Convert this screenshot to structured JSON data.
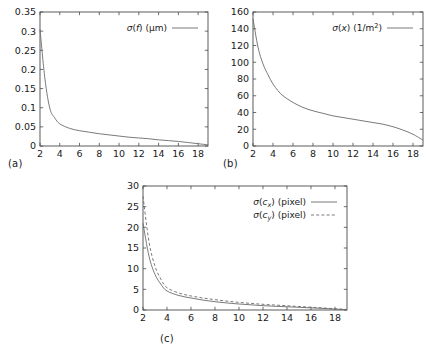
{
  "figure": {
    "panel_labels": {
      "a": "(a)",
      "b": "(b)",
      "c": "(c)"
    }
  },
  "chart_data": [
    {
      "id": "panel-a",
      "type": "line",
      "title": "",
      "panel_label": "(a)",
      "xlabel": "",
      "ylabel": "",
      "xlim": [
        2,
        19
      ],
      "ylim": [
        0,
        0.35
      ],
      "xticks": [
        2,
        4,
        6,
        8,
        10,
        12,
        14,
        16,
        18
      ],
      "xtick_labels": [
        "2",
        "4",
        "6",
        "8",
        "10",
        "12",
        "14",
        "16",
        "18"
      ],
      "yticks": [
        0,
        0.05,
        0.1,
        0.15,
        0.2,
        0.25,
        0.3,
        0.35
      ],
      "ytick_labels": [
        "0",
        "0.05",
        "0.1",
        "0.15",
        "0.2",
        "0.25",
        "0.3",
        "0.35"
      ],
      "grid": false,
      "legend_position": "upper-right",
      "series": [
        {
          "name": "σ(f) (μm)",
          "style": "solid",
          "color": "#6b6b6b",
          "x": [
            2,
            2.5,
            3,
            3.5,
            4,
            5,
            6,
            7,
            8,
            9,
            10,
            11,
            12,
            13,
            14,
            15,
            16,
            17,
            18,
            19
          ],
          "values": [
            0.305,
            0.175,
            0.098,
            0.073,
            0.058,
            0.046,
            0.04,
            0.036,
            0.032,
            0.029,
            0.026,
            0.023,
            0.021,
            0.019,
            0.016,
            0.014,
            0.012,
            0.009,
            0.006,
            0.003
          ]
        }
      ]
    },
    {
      "id": "panel-b",
      "type": "line",
      "title": "",
      "panel_label": "(b)",
      "xlabel": "",
      "ylabel": "",
      "xlim": [
        2,
        19
      ],
      "ylim": [
        0,
        160
      ],
      "xticks": [
        2,
        4,
        6,
        8,
        10,
        12,
        14,
        16,
        18
      ],
      "xtick_labels": [
        "2",
        "4",
        "6",
        "8",
        "10",
        "12",
        "14",
        "16",
        "18"
      ],
      "yticks": [
        0,
        20,
        40,
        60,
        80,
        100,
        120,
        140,
        160
      ],
      "ytick_labels": [
        "0",
        "20",
        "40",
        "60",
        "80",
        "100",
        "120",
        "140",
        "160"
      ],
      "grid": false,
      "legend_position": "upper-right",
      "series": [
        {
          "name": "σ(x) (1/m²)",
          "style": "solid",
          "color": "#6b6b6b",
          "x": [
            2,
            2.5,
            3,
            3.5,
            4,
            4.5,
            5,
            6,
            7,
            8,
            9,
            10,
            11,
            12,
            13,
            14,
            15,
            16,
            17,
            18,
            19
          ],
          "values": [
            152,
            118,
            98,
            85,
            74,
            66,
            60,
            52,
            46,
            42,
            39,
            36,
            34,
            32,
            30,
            28,
            26,
            23,
            19,
            14,
            7
          ]
        }
      ]
    },
    {
      "id": "panel-c",
      "type": "line",
      "title": "",
      "panel_label": "(c)",
      "xlabel": "",
      "ylabel": "",
      "xlim": [
        2,
        19
      ],
      "ylim": [
        0,
        30
      ],
      "xticks": [
        2,
        4,
        6,
        8,
        10,
        12,
        14,
        16,
        18
      ],
      "xtick_labels": [
        "2",
        "4",
        "6",
        "8",
        "10",
        "12",
        "14",
        "16",
        "18"
      ],
      "yticks": [
        0,
        5,
        10,
        15,
        20,
        25,
        30
      ],
      "ytick_labels": [
        "0",
        "5",
        "10",
        "15",
        "20",
        "25",
        "30"
      ],
      "grid": false,
      "legend_position": "upper-right",
      "series": [
        {
          "name": "σ(cₓ) (pixel)",
          "style": "solid",
          "color": "#6b6b6b",
          "x": [
            2,
            2.5,
            3,
            3.5,
            4,
            5,
            6,
            7,
            8,
            9,
            10,
            11,
            12,
            13,
            14,
            15,
            16,
            17,
            18,
            19
          ],
          "values": [
            21.0,
            13.0,
            8.6,
            6.2,
            4.6,
            3.5,
            2.9,
            2.4,
            2.0,
            1.7,
            1.45,
            1.25,
            1.05,
            0.9,
            0.78,
            0.65,
            0.52,
            0.38,
            0.22,
            0.08
          ]
        },
        {
          "name": "σ(cᵧ) (pixel)",
          "style": "dashed",
          "color": "#6b6b6b",
          "x": [
            2,
            2.5,
            3,
            3.5,
            4,
            5,
            6,
            7,
            8,
            9,
            10,
            11,
            12,
            13,
            14,
            15,
            16,
            17,
            18,
            19
          ],
          "values": [
            27.5,
            16.5,
            10.6,
            7.4,
            5.4,
            4.1,
            3.4,
            2.9,
            2.5,
            2.15,
            1.85,
            1.6,
            1.38,
            1.2,
            1.02,
            0.85,
            0.68,
            0.5,
            0.3,
            0.12
          ]
        }
      ]
    }
  ]
}
